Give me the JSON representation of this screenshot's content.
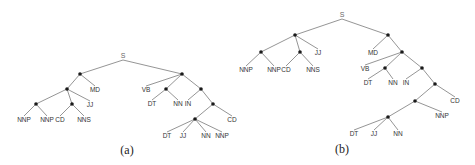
{
  "figure": {
    "trees": [
      {
        "id": "a",
        "caption": "(a)",
        "caption_pos": [
          127,
          151
        ],
        "nodes": [
          {
            "id": "S",
            "label": "S",
            "type": "root",
            "x": 123,
            "y": 56
          },
          {
            "id": "n1",
            "type": "dot",
            "x": 80,
            "y": 74
          },
          {
            "id": "n2",
            "type": "dot",
            "x": 182,
            "y": 74
          },
          {
            "id": "n3",
            "type": "dot",
            "x": 67,
            "y": 89
          },
          {
            "id": "MD1",
            "label": "MD",
            "type": "tag",
            "x": 95,
            "y": 90
          },
          {
            "id": "n4",
            "type": "dot",
            "x": 36,
            "y": 104
          },
          {
            "id": "n5",
            "type": "dot",
            "x": 72,
            "y": 104
          },
          {
            "id": "JJ1",
            "label": "JJ",
            "type": "tag",
            "x": 90,
            "y": 105
          },
          {
            "id": "NNP1",
            "label": "NNP",
            "type": "tag",
            "x": 24,
            "y": 120
          },
          {
            "id": "NNP2",
            "label": "NNP",
            "type": "tag",
            "x": 47,
            "y": 120
          },
          {
            "id": "CD1",
            "label": "CD",
            "type": "tag",
            "x": 60,
            "y": 120
          },
          {
            "id": "NNS1",
            "label": "NNS",
            "type": "tag",
            "x": 84,
            "y": 120
          },
          {
            "id": "VB1",
            "label": "VB",
            "type": "tag",
            "x": 146,
            "y": 90
          },
          {
            "id": "n6",
            "type": "dot",
            "x": 166,
            "y": 89
          },
          {
            "id": "n7",
            "type": "dot",
            "x": 201,
            "y": 89
          },
          {
            "id": "DT1",
            "label": "DT",
            "type": "tag",
            "x": 152,
            "y": 104
          },
          {
            "id": "NN1",
            "label": "NN",
            "type": "tag",
            "x": 178,
            "y": 104
          },
          {
            "id": "IN1",
            "label": "IN",
            "type": "tag",
            "x": 188,
            "y": 104
          },
          {
            "id": "n8",
            "type": "dot",
            "x": 213,
            "y": 104
          },
          {
            "id": "n9",
            "type": "dot",
            "x": 195,
            "y": 119
          },
          {
            "id": "CD2",
            "label": "CD",
            "type": "tag",
            "x": 232,
            "y": 120
          },
          {
            "id": "DT2",
            "label": "DT",
            "type": "tag",
            "x": 167,
            "y": 136
          },
          {
            "id": "JJ2",
            "label": "JJ",
            "type": "tag",
            "x": 183,
            "y": 136
          },
          {
            "id": "NN2",
            "label": "NN",
            "type": "tag",
            "x": 206,
            "y": 136
          },
          {
            "id": "NNP3",
            "label": "NNP",
            "type": "tag",
            "x": 222,
            "y": 136
          }
        ],
        "edges": [
          [
            "S",
            "n1"
          ],
          [
            "S",
            "n2"
          ],
          [
            "n1",
            "n3"
          ],
          [
            "n1",
            "MD1"
          ],
          [
            "n3",
            "n4"
          ],
          [
            "n3",
            "n5"
          ],
          [
            "n3",
            "JJ1"
          ],
          [
            "n4",
            "NNP1"
          ],
          [
            "n4",
            "NNP2"
          ],
          [
            "n5",
            "CD1"
          ],
          [
            "n5",
            "NNS1"
          ],
          [
            "n2",
            "VB1"
          ],
          [
            "n2",
            "n6"
          ],
          [
            "n2",
            "n7"
          ],
          [
            "n6",
            "DT1"
          ],
          [
            "n6",
            "NN1"
          ],
          [
            "n7",
            "IN1"
          ],
          [
            "n7",
            "n8"
          ],
          [
            "n8",
            "n9"
          ],
          [
            "n8",
            "CD2"
          ],
          [
            "n9",
            "DT2"
          ],
          [
            "n9",
            "JJ2"
          ],
          [
            "n9",
            "NN2"
          ],
          [
            "n9",
            "NNP3"
          ]
        ]
      },
      {
        "id": "b",
        "caption": "(b)",
        "caption_pos": [
          342,
          150
        ],
        "nodes": [
          {
            "id": "S",
            "label": "S",
            "type": "root",
            "x": 342,
            "y": 15
          },
          {
            "id": "m1",
            "type": "dot",
            "x": 295,
            "y": 35
          },
          {
            "id": "m2",
            "type": "dot",
            "x": 388,
            "y": 35
          },
          {
            "id": "m3",
            "type": "dot",
            "x": 261,
            "y": 52
          },
          {
            "id": "m4",
            "type": "dot",
            "x": 300,
            "y": 52
          },
          {
            "id": "JJ1",
            "label": "JJ",
            "type": "tag",
            "x": 318,
            "y": 53
          },
          {
            "id": "NNP1",
            "label": "NNP",
            "type": "tag",
            "x": 246,
            "y": 70
          },
          {
            "id": "NNP2",
            "label": "NNP",
            "type": "tag",
            "x": 274,
            "y": 70
          },
          {
            "id": "CD1",
            "label": "CD",
            "type": "tag",
            "x": 286,
            "y": 70
          },
          {
            "id": "NNS1",
            "label": "NNS",
            "type": "tag",
            "x": 313,
            "y": 70
          },
          {
            "id": "MD1",
            "label": "MD",
            "type": "tag",
            "x": 373,
            "y": 53
          },
          {
            "id": "m5",
            "type": "dot",
            "x": 402,
            "y": 52
          },
          {
            "id": "VB1",
            "label": "VB",
            "type": "tag",
            "x": 365,
            "y": 69
          },
          {
            "id": "m6",
            "type": "dot",
            "x": 385,
            "y": 68
          },
          {
            "id": "m7",
            "type": "dot",
            "x": 422,
            "y": 68
          },
          {
            "id": "DT1",
            "label": "DT",
            "type": "tag",
            "x": 368,
            "y": 83
          },
          {
            "id": "NN1",
            "label": "NN",
            "type": "tag",
            "x": 393,
            "y": 83
          },
          {
            "id": "IN1",
            "label": "IN",
            "type": "tag",
            "x": 406,
            "y": 83
          },
          {
            "id": "m8",
            "type": "dot",
            "x": 435,
            "y": 84
          },
          {
            "id": "m9",
            "type": "dot",
            "x": 415,
            "y": 101
          },
          {
            "id": "CD2",
            "label": "CD",
            "type": "tag",
            "x": 455,
            "y": 101
          },
          {
            "id": "m10",
            "type": "dot",
            "x": 388,
            "y": 117
          },
          {
            "id": "NNP3",
            "label": "NNP",
            "type": "tag",
            "x": 442,
            "y": 116
          },
          {
            "id": "DT2",
            "label": "DT",
            "type": "tag",
            "x": 354,
            "y": 134
          },
          {
            "id": "JJ2",
            "label": "JJ",
            "type": "tag",
            "x": 374,
            "y": 134
          },
          {
            "id": "NN2",
            "label": "NN",
            "type": "tag",
            "x": 398,
            "y": 134
          }
        ],
        "edges": [
          [
            "S",
            "m1"
          ],
          [
            "S",
            "m2"
          ],
          [
            "m1",
            "m3"
          ],
          [
            "m1",
            "m4"
          ],
          [
            "m1",
            "JJ1"
          ],
          [
            "m3",
            "NNP1"
          ],
          [
            "m3",
            "NNP2"
          ],
          [
            "m4",
            "CD1"
          ],
          [
            "m4",
            "NNS1"
          ],
          [
            "m2",
            "MD1"
          ],
          [
            "m2",
            "m5"
          ],
          [
            "m5",
            "VB1"
          ],
          [
            "m5",
            "m6"
          ],
          [
            "m5",
            "m7"
          ],
          [
            "m6",
            "DT1"
          ],
          [
            "m6",
            "NN1"
          ],
          [
            "m7",
            "IN1"
          ],
          [
            "m7",
            "m8"
          ],
          [
            "m8",
            "m9"
          ],
          [
            "m8",
            "CD2"
          ],
          [
            "m9",
            "m10"
          ],
          [
            "m9",
            "NNP3"
          ],
          [
            "m10",
            "DT2"
          ],
          [
            "m10",
            "JJ2"
          ],
          [
            "m10",
            "NN2"
          ]
        ]
      }
    ]
  }
}
